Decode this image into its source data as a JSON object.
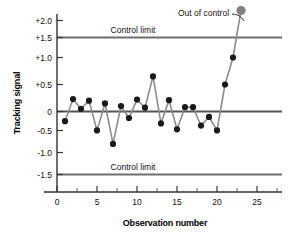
{
  "chart_data": {
    "type": "line",
    "title": "",
    "xlabel": "Observation number",
    "ylabel": "Tracking signal",
    "xlim": [
      0,
      27
    ],
    "ylim": [
      -1.85,
      2.2
    ],
    "grid": false,
    "legend": "none",
    "x": [
      1,
      2,
      3,
      4,
      5,
      6,
      7,
      8,
      9,
      10,
      11,
      12,
      13,
      14,
      15,
      16,
      17,
      18,
      19,
      20,
      21,
      22,
      23
    ],
    "values": [
      -0.18,
      0.23,
      0.05,
      0.2,
      -0.35,
      0.15,
      -0.6,
      0.1,
      -0.12,
      0.22,
      0.07,
      0.65,
      -0.22,
      0.21,
      -0.33,
      0.08,
      0.08,
      -0.26,
      -0.1,
      -0.35,
      0.5,
      1.0,
      1.87
    ],
    "series": [
      {
        "name": "Tracking signal",
        "values": [
          -0.18,
          0.23,
          0.05,
          0.2,
          -0.35,
          0.15,
          -0.6,
          0.1,
          -0.12,
          0.22,
          0.07,
          0.65,
          -0.22,
          0.21,
          -0.33,
          0.08,
          0.08,
          -0.26,
          -0.1,
          -0.35,
          0.5,
          1.0,
          1.87
        ]
      }
    ],
    "xticks": [
      0,
      5,
      10,
      15,
      20,
      25
    ],
    "xtick_labels": [
      "0",
      "5",
      "10",
      "15",
      "20",
      "25"
    ],
    "xminor_ticks": [
      2.5,
      7.5,
      12.5,
      17.5,
      22.5
    ],
    "yticks": [
      2.0,
      1.5,
      1.0,
      0.5,
      0,
      -0.5,
      -1.0,
      -1.5
    ],
    "ytick_labels": [
      "+2.0",
      "+1.5",
      "+1.0",
      "+0.5",
      "0",
      "-0.5",
      "-1.0",
      "-1.5"
    ],
    "reference_lines": [
      {
        "name": "upper-control-limit",
        "value": 1.5,
        "label": "Control limit"
      },
      {
        "name": "center-line",
        "value": 0,
        "label": ""
      },
      {
        "name": "lower-control-limit",
        "value": -1.5,
        "label": "Control limit"
      }
    ],
    "annotations": [
      {
        "name": "out-of-control",
        "text": "Out of control",
        "points_to_x": 23,
        "points_to_y": 1.87
      }
    ],
    "highlight_point": {
      "x": 23,
      "y": 1.87,
      "color": "#808080"
    },
    "colors": {
      "line": "#8c8c8c",
      "marker": "#1a1a1a",
      "highlight_marker": "#808080",
      "limit_line": "#6e6e6e",
      "axis": "#333333",
      "text": "#111111"
    }
  },
  "labels": {
    "upper_limit_text": "Control limit",
    "lower_limit_text": "Control limit",
    "out_of_control_text": "Out of control"
  }
}
